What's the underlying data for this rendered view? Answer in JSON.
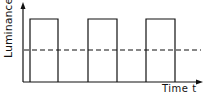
{
  "diagram": {
    "ylabel": "Luminance",
    "xlabel": "Time t",
    "pulses": [
      {
        "x1": 30,
        "x2": 58
      },
      {
        "x1": 88,
        "x2": 117
      },
      {
        "x1": 146,
        "x2": 175
      }
    ],
    "pulse_top_y": 19,
    "baseline_y": 82,
    "mean_line_y": 50,
    "line_color": "#111111"
  }
}
